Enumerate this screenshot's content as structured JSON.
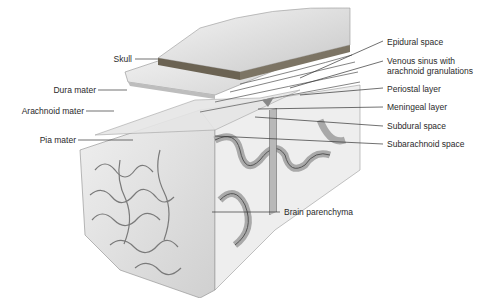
{
  "diagram": {
    "labels_left": [
      {
        "id": "skull",
        "text": "Skull"
      },
      {
        "id": "dura-mater",
        "text": "Dura mater"
      },
      {
        "id": "arachnoid-mater",
        "text": "Arachnoid mater"
      },
      {
        "id": "pia-mater",
        "text": "Pia mater"
      }
    ],
    "labels_right": [
      {
        "id": "epidural-space",
        "text": "Epidural space"
      },
      {
        "id": "venous-sinus-line1",
        "text": "Venous sinus with"
      },
      {
        "id": "venous-sinus-line2",
        "text": "arachnoid granulations"
      },
      {
        "id": "periostal-layer",
        "text": "Periostal layer"
      },
      {
        "id": "meningeal-layer",
        "text": "Meningeal layer"
      },
      {
        "id": "subdural-space",
        "text": "Subdural space"
      },
      {
        "id": "subarachnoid-space",
        "text": "Subarachnoid space"
      }
    ],
    "labels_bottom": [
      {
        "id": "brain-parenchyma",
        "text": "Brain parenchyma"
      }
    ],
    "colors": {
      "background": "#ffffff",
      "label_text": "#2a2a2a",
      "leader_line": "#333333",
      "gray_matter": "#a9a9a9",
      "white_matter": "#eeeeee",
      "gyri_surface": "#e2e2e2",
      "skull": "#dcdcdc",
      "skull_edge": "#6b6353"
    }
  }
}
